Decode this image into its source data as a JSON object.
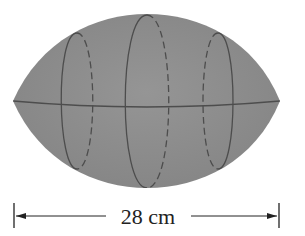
{
  "figure": {
    "fill_color": "#8e8e8e",
    "seam_color": "#4a4a4a",
    "dimension": {
      "label": "28 cm",
      "quantity": 28,
      "unit": "cm",
      "description": "length of football"
    },
    "cross_sections": [
      {
        "name": "left",
        "cx": 77,
        "rx": 16,
        "ry": 68
      },
      {
        "name": "center",
        "cx": 147,
        "rx": 24,
        "ry": 86
      },
      {
        "name": "right",
        "cx": 218,
        "rx": 16,
        "ry": 68
      }
    ]
  }
}
